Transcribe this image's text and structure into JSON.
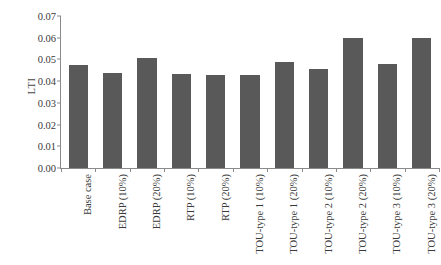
{
  "chart_data": {
    "type": "bar",
    "title": "",
    "subtitle": "",
    "xlabel": "",
    "ylabel": "LTI",
    "ylim": [
      0.0,
      0.07
    ],
    "ytick_step": 0.01,
    "yticks": [
      "0.00",
      "0.01",
      "0.02",
      "0.03",
      "0.04",
      "0.05",
      "0.06",
      "0.07"
    ],
    "grid": false,
    "legend": null,
    "bar_color": "#595959",
    "axis_color": "#8a8a8a",
    "xtick_rotation": -90,
    "categories": [
      "Base case",
      "EDRP (10%)",
      "EDRP (20%)",
      "RTP (10%)",
      "RTP (20%)",
      "TOU-type 1 (10%)",
      "TOU-type 1 (20%)",
      "TOU-type 2 (10%)",
      "TOU-type 2 (20%)",
      "TOU-type 3 (10%)",
      "TOU-type 3 (20%)"
    ],
    "values": [
      0.0474,
      0.0438,
      0.0508,
      0.0435,
      0.0428,
      0.0428,
      0.049,
      0.0455,
      0.06,
      0.0478,
      0.06
    ],
    "series": [
      {
        "name": "LTI",
        "values": [
          0.0474,
          0.0438,
          0.0508,
          0.0435,
          0.0428,
          0.0428,
          0.049,
          0.0455,
          0.06,
          0.0478,
          0.06
        ]
      }
    ]
  }
}
